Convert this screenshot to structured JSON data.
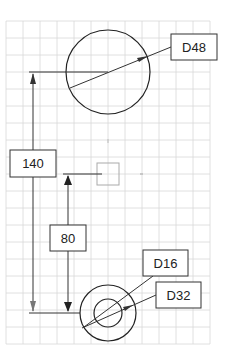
{
  "drawing": {
    "grid": {
      "x_lines": [
        6,
        23,
        40,
        57,
        74,
        91,
        108,
        125,
        142,
        159,
        176,
        193,
        210
      ],
      "y_lines": [
        21,
        38,
        55,
        72,
        89,
        106,
        123,
        140,
        157,
        174,
        191,
        208,
        225,
        242,
        259,
        276,
        293,
        310,
        327,
        344
      ],
      "color": "#d8d8d8"
    },
    "large_circle": {
      "cx": 108,
      "cy": 72,
      "r": 42
    },
    "small_outer_circle": {
      "cx": 108,
      "cy": 313,
      "r": 28
    },
    "small_inner_circle": {
      "cx": 108,
      "cy": 313,
      "r": 14
    },
    "origin_marker": {
      "x": 97,
      "y": 163,
      "size": 22
    },
    "dimensions": {
      "d48": {
        "label": "D48"
      },
      "d16": {
        "label": "D16"
      },
      "d32": {
        "label": "D32"
      },
      "dist140": {
        "label": "140"
      },
      "dist80": {
        "label": "80"
      }
    }
  }
}
